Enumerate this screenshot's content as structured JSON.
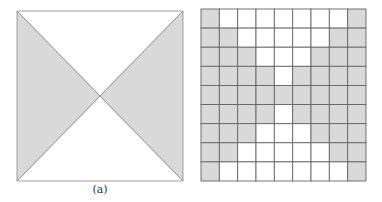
{
  "figure": {
    "panels": [
      {
        "id": "a",
        "caption": "(a)",
        "description": "Square divided by its two diagonals; left and right triangles shaded, top and bottom triangles white",
        "shaded_triangles": [
          "left",
          "right"
        ],
        "white_triangles": [
          "top",
          "bottom"
        ]
      },
      {
        "id": "b",
        "caption": "(b)",
        "description": "9x9 grid discretization of the bow-tie pattern",
        "rows": 9,
        "cols": 9,
        "cells": [
          "SWWWWWWWS",
          "SSWWWWWSS",
          "SSSWWWSSS",
          "SSSSWSSSS",
          "SSSSSSSSS",
          "SSSSWSSSS",
          "SSSWWWSSS",
          "SSWWWWWSS",
          "SWWWWWWWS"
        ]
      }
    ],
    "colors": {
      "shade": "#d9d9d9",
      "white": "#ffffff",
      "line": "#666666",
      "outline": "#888888"
    }
  }
}
